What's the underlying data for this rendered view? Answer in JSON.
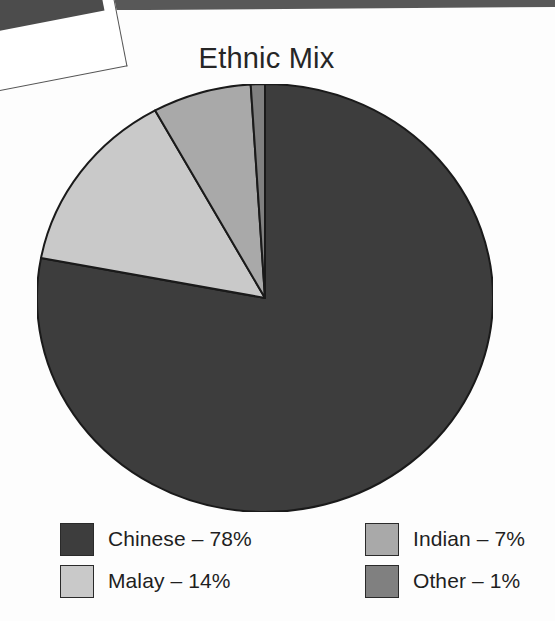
{
  "chart_data": {
    "type": "pie",
    "title": "Ethnic Mix",
    "categories": [
      "Chinese",
      "Malay",
      "Indian",
      "Other"
    ],
    "values": [
      78,
      14,
      7,
      1
    ],
    "unit": "%",
    "start_angle_deg": 0,
    "direction": "clockwise",
    "legend_position": "bottom",
    "grid": false,
    "colors": [
      "#3d3d3d",
      "#c9c9c9",
      "#a9a9a9",
      "#808080"
    ],
    "slice_outline_color": "#1a1a1a",
    "labels": [
      "Chinese – 78%",
      "Malay – 14%",
      "Indian – 7%",
      "Other – 1%"
    ],
    "legend": [
      {
        "label": "Chinese – 78%",
        "name": "Chinese",
        "value": 78,
        "color": "#3d3d3d"
      },
      {
        "label": "Malay – 14%",
        "name": "Malay",
        "value": 14,
        "color": "#c9c9c9"
      },
      {
        "label": "Indian – 7%",
        "name": "Indian",
        "value": 7,
        "color": "#a9a9a9"
      },
      {
        "label": "Other – 1%",
        "name": "Other",
        "value": 1,
        "color": "#808080"
      }
    ]
  },
  "page": {
    "background": "#fdfdfd",
    "text_color": "#1f1f1f"
  }
}
